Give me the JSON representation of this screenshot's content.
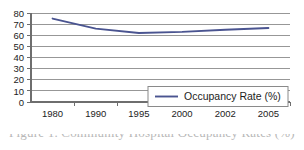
{
  "chart_data": {
    "type": "line",
    "title": "",
    "subtitle": "",
    "xlabel": "",
    "ylabel": "",
    "categories": [
      "1980",
      "1990",
      "1995",
      "2000",
      "2002",
      "2005"
    ],
    "series": [
      {
        "name": "Occupancy Rate (%)",
        "color": "#4a5490",
        "values": [
          75,
          66,
          62,
          63,
          65,
          66.5
        ]
      }
    ],
    "ylim": [
      0,
      80
    ],
    "ytick_step": 10,
    "ytick_labels": [
      "0",
      "10",
      "20",
      "30",
      "40",
      "50",
      "60",
      "70",
      "80"
    ],
    "grid": true,
    "grid_axis": "y",
    "legend_position": "lower-right-inside",
    "legend_entries": [
      "Occupancy Rate (%)"
    ]
  },
  "legend": {
    "series_label": "Occupancy Rate (%)"
  },
  "axes": {
    "y_ticks": [
      "80",
      "70",
      "60",
      "50",
      "40",
      "30",
      "20",
      "10",
      "0"
    ],
    "x_ticks": [
      "1980",
      "1990",
      "1995",
      "2000",
      "2002",
      "2005"
    ]
  },
  "caption": {
    "text": "Figure 1. Community Hospital Occupancy Rates (%)"
  },
  "colors": {
    "series_line": "#4a5490",
    "gridline": "#8c8c8c",
    "axis": "#6e6e6e",
    "background": "#ffffff",
    "text": "#1c1c1c"
  }
}
